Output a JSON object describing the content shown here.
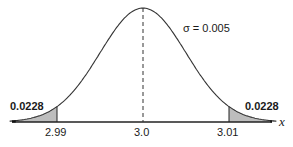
{
  "chart_data": {
    "type": "area",
    "title": "",
    "distribution": "normal",
    "mean": 3.0,
    "sigma": 3.005,
    "sigma_label": "σ = 0.005",
    "xlabel": "x",
    "ylabel": "",
    "x_ticks": [
      "2.99",
      "3.0",
      "3.01"
    ],
    "x_tick_values": [
      2.99,
      3.0,
      3.01
    ],
    "shaded_regions": [
      {
        "from": "-inf",
        "to": 2.99,
        "area": 0.0228,
        "label": "0.0228"
      },
      {
        "from": 3.01,
        "to": "inf",
        "area": 0.0228,
        "label": "0.0228"
      }
    ],
    "annotations": [
      "σ = 0.005",
      "0.0228",
      "0.0228"
    ],
    "mean_line": {
      "x": 3.0,
      "style": "dashed"
    },
    "grid": false,
    "legend": false
  },
  "labels": {
    "sigma": "σ = 0.005",
    "left_tail": "0.0228",
    "right_tail": "0.0228",
    "tick_left": "2.99",
    "tick_center": "3.0",
    "tick_right": "3.01",
    "x_axis": "x"
  }
}
